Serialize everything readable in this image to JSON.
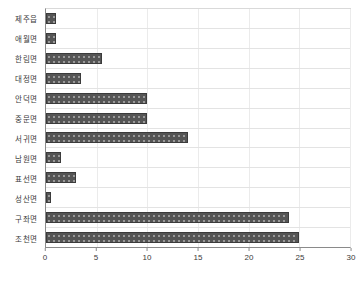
{
  "chart_data": {
    "type": "bar",
    "orientation": "horizontal",
    "title": "",
    "subtitle": "",
    "xlabel": "",
    "ylabel": "",
    "xlim": [
      0,
      30
    ],
    "xticks": [
      0,
      5,
      10,
      15,
      20,
      25,
      30
    ],
    "xtick_labels": [
      "0",
      "5",
      "10",
      "15",
      "20",
      "25",
      "30"
    ],
    "grid": {
      "vertical": true,
      "horizontal": true
    },
    "legend": {
      "visible": false,
      "position": "none",
      "entries": []
    },
    "annotations": [],
    "categories": [
      "제주읍",
      "애월면",
      "한림면",
      "대정면",
      "안덕면",
      "중문면",
      "서귀면",
      "남원면",
      "표선면",
      "성산면",
      "구좌면",
      "조천면"
    ],
    "values": [
      1,
      1,
      5.5,
      3.5,
      10,
      10,
      14,
      1.5,
      3,
      0.5,
      24,
      25
    ],
    "series": [
      {
        "name": "",
        "values": [
          1,
          1,
          5.5,
          3.5,
          10,
          10,
          14,
          1.5,
          3,
          0.5,
          24,
          25
        ],
        "color": "#555555"
      }
    ]
  },
  "style": {
    "bar_color": "#555555",
    "bar_edge_color": "#3b3b3b",
    "axis_color": "#8a8a8a",
    "grid_color": "#e3e3e3",
    "text_color": "#3a3a3a",
    "background": "#ffffff"
  }
}
